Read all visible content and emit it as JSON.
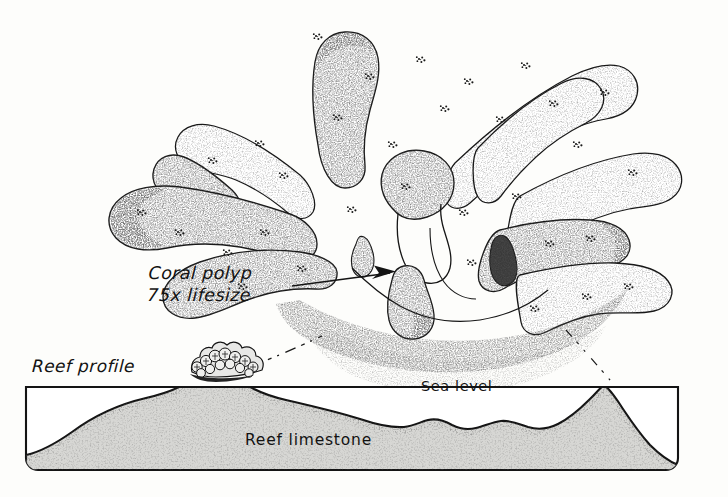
{
  "figure": {
    "kind": "scientific-pen-and-ink-illustration",
    "background_color": "#fdfdfb",
    "ink_color": "#141414",
    "limestone_fill_color": "#d6d6d3"
  },
  "labels": {
    "coral_polyp_line1": "Coral polyp",
    "coral_polyp_line2": "75x lifesize",
    "reef_profile": "Reef profile",
    "sea_level": "Sea level",
    "reef_limestone": "Reef limestone"
  },
  "annotations": {
    "arrow_from_polyp_label": "arrow pointing from the 'Coral polyp 75x lifesize' caption up-right into the magnified polyp body",
    "magnification_leader_left": "dashed leader line from the coral colony on the reef crest up-right to the magnified polyp",
    "magnification_leader_right": "dashed leader line from the magnified polyp down-right into the reef profile box"
  },
  "reef_profile_box": {
    "left": 26,
    "top": 387,
    "right": 678,
    "bottom": 470,
    "sea_level_line_y": 387,
    "crest_x": 216,
    "secondary_rise_x": 597
  }
}
